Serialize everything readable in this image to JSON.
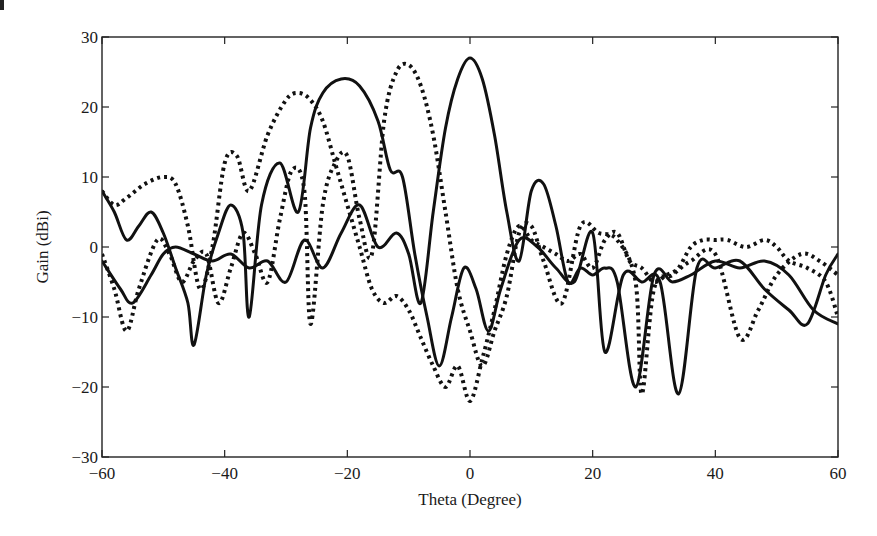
{
  "chart_data": {
    "type": "line",
    "title": "",
    "xlabel": "Theta (Degree)",
    "ylabel": "Gain (dBi)",
    "xlim": [
      -60,
      60
    ],
    "ylim": [
      -30,
      30
    ],
    "xticks": [
      -60,
      -40,
      -20,
      0,
      20,
      40,
      60
    ],
    "xtick_labels": [
      "−60",
      "−40",
      "−20",
      "0",
      "20",
      "40",
      "60"
    ],
    "yticks": [
      -30,
      -20,
      -10,
      0,
      10,
      20,
      30
    ],
    "ytick_labels": [
      "−30",
      "−20",
      "−10",
      "0",
      "10",
      "20",
      "30"
    ],
    "grid": false,
    "legend": null,
    "series": [
      {
        "name": "Beam 0° (solid)",
        "style": "solid",
        "x": [
          -60,
          -57,
          -55,
          -52,
          -50,
          -48,
          -45,
          -42,
          -39,
          -36,
          -33,
          -30,
          -27,
          -24,
          -21,
          -18,
          -15,
          -12,
          -10,
          -8,
          -6,
          -4,
          -2,
          0,
          2,
          4,
          6,
          8,
          10,
          12,
          14,
          16,
          18,
          20,
          22,
          24,
          27,
          30,
          33,
          36,
          40,
          44,
          48,
          52,
          56,
          60
        ],
        "y": [
          -2,
          -6,
          -8,
          -4,
          -1,
          0,
          -1,
          -2,
          -1,
          -3,
          -2,
          -5,
          1,
          -3,
          2,
          6,
          0,
          2,
          -1,
          -8,
          5,
          17,
          24,
          27,
          24,
          16,
          5,
          -2,
          8,
          9,
          3,
          -5,
          -3,
          -4,
          -3,
          -5,
          -20,
          -4,
          -5,
          -4,
          -2,
          -3,
          -2,
          -4,
          -9,
          -11
        ]
      },
      {
        "name": "Beam −20° (solid)",
        "style": "solid",
        "x": [
          -60,
          -58,
          -56,
          -54,
          -52,
          -50,
          -48,
          -46,
          -45,
          -43,
          -41,
          -39,
          -37,
          -36,
          -34,
          -31,
          -28,
          -26,
          -24,
          -21,
          -18,
          -15,
          -13,
          -11,
          -9,
          -7,
          -5,
          -3,
          -1,
          1,
          3,
          5,
          8,
          11,
          14,
          17,
          20,
          22,
          25,
          28,
          31,
          34,
          37,
          40,
          44,
          48,
          52,
          55,
          58,
          60
        ],
        "y": [
          8,
          5,
          1,
          3,
          5,
          2,
          -3,
          -8,
          -14,
          -4,
          2,
          6,
          2,
          -10,
          6,
          12,
          5,
          17,
          22,
          24,
          23,
          18,
          11,
          10,
          -1,
          -10,
          -17,
          -10,
          -3,
          -6,
          -12,
          -6,
          1,
          0,
          -3,
          -5,
          2,
          -15,
          -4,
          -5,
          -5,
          -21,
          -3,
          -3,
          -2,
          -6,
          -9,
          -11,
          -4,
          -1
        ]
      },
      {
        "name": "Beam −10° (dotted)",
        "style": "dotted",
        "x": [
          -60,
          -58,
          -56,
          -54,
          -51,
          -49,
          -47,
          -45,
          -43,
          -41,
          -39,
          -37,
          -35,
          -33,
          -31,
          -29,
          -27,
          -26,
          -24,
          -22,
          -20,
          -18,
          -16,
          -14,
          -12,
          -10,
          -8,
          -6,
          -4,
          -2,
          0,
          2,
          4,
          6,
          8,
          10,
          12,
          15,
          18,
          21,
          24,
          27,
          28,
          30,
          33,
          36,
          40,
          44,
          47,
          50,
          54,
          57,
          60
        ],
        "y": [
          -1,
          -6,
          -12,
          -6,
          1,
          -1,
          -5,
          -2,
          -1,
          -8,
          -3,
          2,
          -1,
          -5,
          4,
          11,
          8,
          -11,
          6,
          12,
          13,
          4,
          -1,
          18,
          25,
          26,
          23,
          16,
          5,
          -6,
          -12,
          -17,
          -12,
          -7,
          2,
          3,
          -2,
          -8,
          3,
          2,
          1,
          -5,
          -21,
          -6,
          -4,
          -2,
          -1,
          -13,
          -9,
          -4,
          -1,
          -2,
          -4
        ]
      },
      {
        "name": "Beam −28° (dotted)",
        "style": "dotted",
        "x": [
          -60,
          -58,
          -56,
          -53,
          -50,
          -48,
          -46,
          -44,
          -42,
          -40,
          -38,
          -36,
          -33,
          -30,
          -28,
          -26,
          -24,
          -22,
          -20,
          -18,
          -16,
          -14,
          -12,
          -10,
          -8,
          -6,
          -4,
          -2,
          0,
          2,
          4,
          6,
          8,
          10,
          12,
          14,
          16,
          18,
          20,
          22,
          24,
          26,
          28,
          30,
          32,
          34,
          36,
          38,
          40,
          42,
          45,
          48,
          50,
          52,
          55,
          58,
          60
        ],
        "y": [
          8,
          6,
          7,
          9,
          10,
          9,
          3,
          -6,
          0,
          12,
          13,
          8,
          16,
          21,
          22,
          21,
          18,
          12,
          6,
          0,
          -6,
          -8,
          -7,
          -9,
          -13,
          -17,
          -20,
          -17,
          -22,
          -16,
          -9,
          -1,
          3,
          1,
          0,
          -1,
          -2,
          -1,
          -3,
          1,
          2,
          -2,
          -3,
          -5,
          -4,
          -3,
          0,
          1,
          1,
          1,
          0,
          1,
          0,
          -2,
          -3,
          -5,
          -10
        ]
      }
    ]
  }
}
